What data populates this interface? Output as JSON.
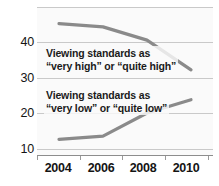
{
  "chart_data": {
    "type": "line",
    "title": "",
    "xlabel": "",
    "ylabel": "",
    "x": [
      2004,
      2006,
      2008,
      2010
    ],
    "tick_labels_x": [
      "2004",
      "2006",
      "2008",
      "2010"
    ],
    "tick_labels_y": [
      "10",
      "20",
      "30",
      "40"
    ],
    "ylim": [
      5,
      50
    ],
    "xlim": [
      2003,
      2011
    ],
    "grid": true,
    "legend_position": "inline-annotations",
    "series": [
      {
        "name": "Viewing standards as “very high” or “quite high”",
        "values": [
          45,
          44,
          40,
          31
        ],
        "color": "#8a8a8a"
      },
      {
        "name": "Viewing standards as “very low” or “quite low”",
        "values": [
          10,
          11,
          18,
          22
        ],
        "color": "#8a8a8a"
      }
    ],
    "annotations": [
      {
        "id": "high",
        "line1": "Viewing standards as",
        "line2": "“very high” or “quite high”"
      },
      {
        "id": "low",
        "line1": "Viewing standards as",
        "line2": "“very low” or “quite low”"
      }
    ]
  },
  "axes": {
    "y_ticks": [
      {
        "label": "40",
        "top": 42
      },
      {
        "label": "30",
        "top": 78
      },
      {
        "label": "20",
        "top": 113
      },
      {
        "label": "10",
        "top": 149
      }
    ],
    "x_ticks": [
      {
        "label": "2004",
        "left": 58
      },
      {
        "label": "2006",
        "left": 101
      },
      {
        "label": "2008",
        "left": 143
      },
      {
        "label": "2010",
        "left": 186
      }
    ]
  },
  "style": {
    "line_color": "#8a8a8a",
    "grid_color": "#c9c9c9",
    "plot_background": "#fafafa",
    "text_color": "#141414"
  }
}
